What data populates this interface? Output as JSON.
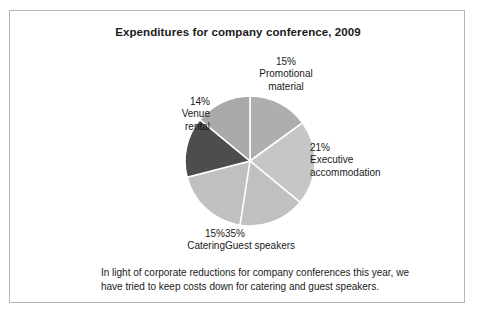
{
  "figure": {
    "title": "Expenditures for company conference, 2009",
    "caption": "In light of corporate reductions for company conferences this year, we have tried to keep costs down for catering and guest speakers."
  },
  "labels": {
    "promotional": "15%\nPromotional\nmaterial",
    "executive": "21%\nExecutive\naccommodation",
    "guest": "35%\nGuest speakers",
    "catering": "15%\nCatering",
    "venue": "14%\nVenue\nrental"
  },
  "chart_data": {
    "type": "pie",
    "title": "Expenditures for company conference, 2009",
    "categories": [
      "Promotional material",
      "Executive accommodation",
      "Guest speakers",
      "Catering",
      "Venue rental"
    ],
    "values": [
      15,
      21,
      35,
      15,
      14
    ],
    "unit": "%",
    "total": 100,
    "start_angle_deg": 0,
    "direction": "clockwise",
    "legend": "none",
    "labels_position": "outside",
    "slice_colors": [
      "#aeaeae",
      "#c6c6c6",
      "#c0c0c0",
      "#4d4d4d",
      "#a9a9a9"
    ],
    "separator_color": "#ffffff",
    "slices": [
      {
        "name": "Promotional material",
        "value": 15,
        "label": "15%",
        "color": "#aeaeae"
      },
      {
        "name": "Executive accommodation",
        "value": 21,
        "label": "21%",
        "color": "#c6c6c6"
      },
      {
        "name": "Guest speakers",
        "value": 35,
        "label": "35%",
        "color": "#c0c0c0"
      },
      {
        "name": "Catering",
        "value": 15,
        "label": "15%",
        "color": "#4d4d4d"
      },
      {
        "name": "Venue rental",
        "value": 14,
        "label": "14%",
        "color": "#a9a9a9"
      }
    ]
  }
}
